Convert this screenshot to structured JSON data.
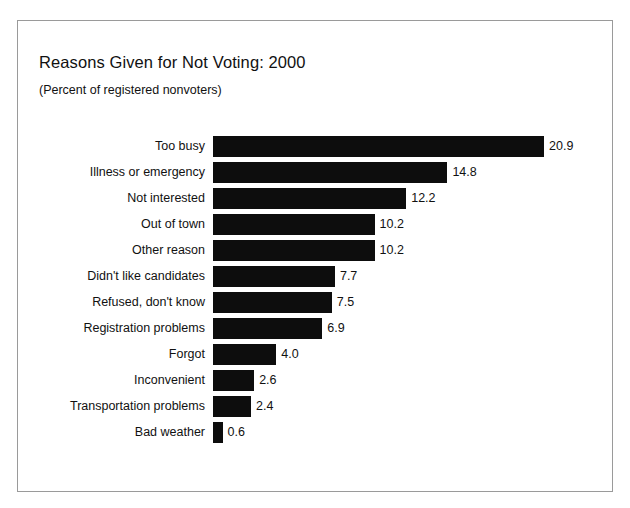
{
  "chart_data": {
    "type": "bar",
    "orientation": "horizontal",
    "title": "Reasons Given for Not Voting: 2000",
    "subtitle": "(Percent of registered nonvoters)",
    "xlabel": "",
    "ylabel": "",
    "xlim": [
      0,
      20.9
    ],
    "grid": false,
    "legend": null,
    "bar_color": "#0d0d0d",
    "categories": [
      "Too busy",
      "Illness or emergency",
      "Not interested",
      "Out of town",
      "Other reason",
      "Didn't like candidates",
      "Refused, don't know",
      "Registration problems",
      "Forgot",
      "Inconvenient",
      "Transportation problems",
      "Bad weather"
    ],
    "values": [
      20.9,
      14.8,
      12.2,
      10.2,
      10.2,
      7.7,
      7.5,
      6.9,
      4.0,
      2.6,
      2.4,
      0.6
    ],
    "value_labels": [
      "20.9",
      "14.8",
      "12.2",
      "10.2",
      "10.2",
      "7.7",
      "7.5",
      "6.9",
      "4.0",
      "2.6",
      "2.4",
      "0.6"
    ],
    "bars": [
      {
        "label": "Too busy",
        "value": 20.9,
        "value_label": "20.9"
      },
      {
        "label": "Illness or emergency",
        "value": 14.8,
        "value_label": "14.8"
      },
      {
        "label": "Not interested",
        "value": 12.2,
        "value_label": "12.2"
      },
      {
        "label": "Out of town",
        "value": 10.2,
        "value_label": "10.2"
      },
      {
        "label": "Other reason",
        "value": 10.2,
        "value_label": "10.2"
      },
      {
        "label": "Didn't like candidates",
        "value": 7.7,
        "value_label": "7.7"
      },
      {
        "label": "Refused, don't know",
        "value": 7.5,
        "value_label": "7.5"
      },
      {
        "label": "Registration problems",
        "value": 6.9,
        "value_label": "6.9"
      },
      {
        "label": "Forgot",
        "value": 4.0,
        "value_label": "4.0"
      },
      {
        "label": "Inconvenient",
        "value": 2.6,
        "value_label": "2.6"
      },
      {
        "label": "Transportation problems",
        "value": 2.4,
        "value_label": "2.4"
      },
      {
        "label": "Bad weather",
        "value": 0.6,
        "value_label": "0.6"
      }
    ]
  }
}
